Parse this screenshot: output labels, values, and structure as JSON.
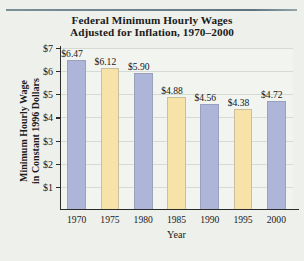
{
  "chart_data": {
    "type": "bar",
    "title": "Federal Minimum Hourly Wages Adjusted for Inflation, 1970–2000",
    "title_line1": "Federal Minimum Hourly Wages",
    "title_line2": "Adjusted for Inflation, 1970–2000",
    "xlabel": "Year",
    "ylabel": "Minimum Hourly Wage in Constant 1996 Dollars",
    "ylabel_line1": "Minimum Hourly Wage",
    "ylabel_line2": "in Constant 1996 Dollars",
    "categories": [
      "1970",
      "1975",
      "1980",
      "1985",
      "1990",
      "1995",
      "2000"
    ],
    "values": [
      6.47,
      6.12,
      5.9,
      4.88,
      4.56,
      4.38,
      4.72
    ],
    "data_labels": [
      "$6.47",
      "$6.12",
      "$5.90",
      "$4.88",
      "$4.56",
      "$4.38",
      "$4.72"
    ],
    "bar_colors": [
      "#adb6d8",
      "#f7e3a8",
      "#adb6d8",
      "#f7e3a8",
      "#adb6d8",
      "#f7e3a8",
      "#adb6d8"
    ],
    "ylim": [
      0,
      7
    ],
    "ytick_labels": [
      "$1",
      "$2",
      "$3",
      "$4",
      "$5",
      "$6",
      "$7"
    ],
    "ytick_values": [
      1,
      2,
      3,
      4,
      5,
      6,
      7
    ],
    "grid": true,
    "legend": null,
    "colors": {
      "blue": "#adb6d8",
      "yellow": "#f7e3a8",
      "background": "#edf0eb",
      "plot_background": "#f2f4f0",
      "axis": "#2b2b2b",
      "rule": "#5d7480"
    }
  }
}
